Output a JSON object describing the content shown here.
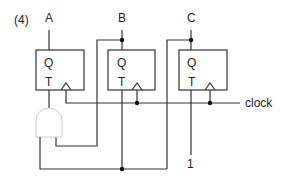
{
  "diagram": {
    "problem_label": "(4)",
    "flip_flops": [
      {
        "id": "ff-a",
        "output_label": "A",
        "q_label": "Q",
        "t_label": "T"
      },
      {
        "id": "ff-b",
        "output_label": "B",
        "q_label": "Q",
        "t_label": "T"
      },
      {
        "id": "ff-c",
        "output_label": "C",
        "q_label": "Q",
        "t_label": "T"
      }
    ],
    "gate": {
      "type": "AND",
      "inputs": [
        "B",
        "C"
      ],
      "output": "T of flip-flop A"
    },
    "clock_label": "clock",
    "constant_input_label": "1",
    "colors": {
      "wire": "#333333",
      "gate_outline": "#cccccc",
      "background": "#ffffff"
    }
  }
}
